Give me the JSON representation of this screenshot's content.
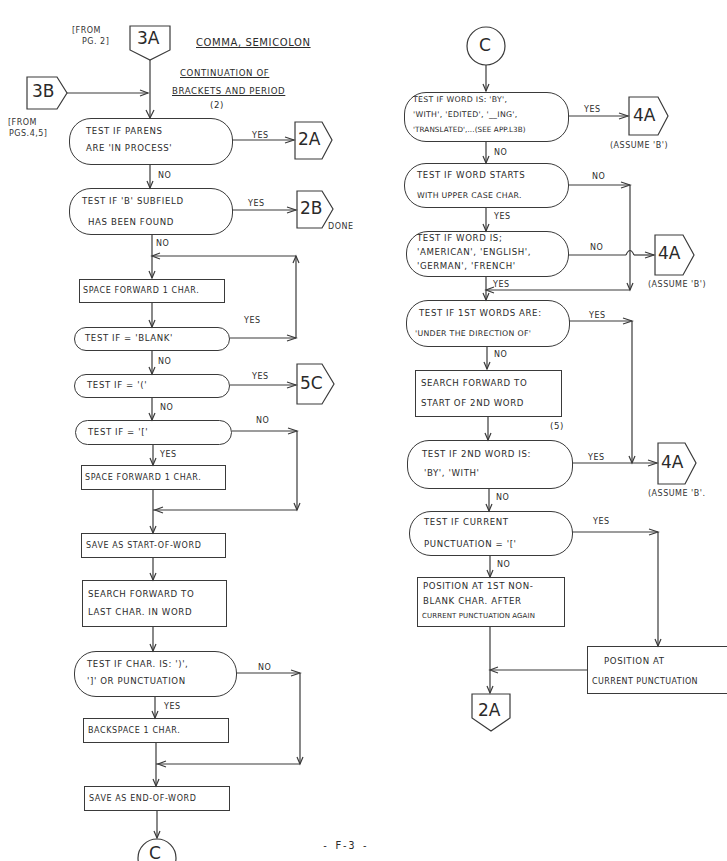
{
  "header": {
    "title": "COMMA, SEMICOLON",
    "subtitle_line1": "CONTINUATION OF",
    "subtitle_line2": "BRACKETS AND PERIOD",
    "step_2": "(2)",
    "page_number": "- F-3 -"
  },
  "connectors": {
    "entry_3a": "3A",
    "entry_3a_note_1": "[FROM",
    "entry_3a_note_2": "PG. 2]",
    "entry_3b": "3B",
    "entry_3b_note_1": "[FROM",
    "entry_3b_note_2": "PGS.4,5]",
    "exit_2a_top": "2A",
    "exit_2b": "2B",
    "exit_2b_note": "DONE",
    "exit_5c": "5C",
    "exit_c_bottom": "C",
    "entry_c_top": "C",
    "exit_4a_1": "4A",
    "exit_4a_1_note": "(ASSUME 'B')",
    "exit_4a_2": "4A",
    "exit_4a_2_note": "(ASSUME 'B')",
    "exit_4a_3": "4A",
    "exit_4a_3_note": "(ASSUME 'B'.",
    "exit_2a_bottom": "2A"
  },
  "left_flow": {
    "parens": {
      "line1": "TEST IF PARENS",
      "line2": "ARE 'IN PROCESS'"
    },
    "b_subfield": {
      "line1": "TEST IF 'B' SUBFIELD",
      "line2": "HAS BEEN FOUND"
    },
    "space_forward_1": "SPACE FORWARD 1 CHAR.",
    "test_blank": "TEST IF = 'BLANK'",
    "test_paren": "TEST IF = '('",
    "test_bracket": "TEST IF = '['",
    "space_forward_2": "SPACE FORWARD 1 CHAR.",
    "save_start": "SAVE AS START-OF-WORD",
    "search_last": {
      "line1": "SEARCH FORWARD TO",
      "line2": "LAST CHAR. IN WORD"
    },
    "test_char": {
      "line1": "TEST IF CHAR. IS: ')',",
      "line2": "']' OR PUNCTUATION"
    },
    "backspace": "BACKSPACE 1 CHAR.",
    "save_end": "SAVE AS END-OF-WORD"
  },
  "right_flow": {
    "test_word_by": {
      "line1": "TEST IF WORD IS: 'BY',",
      "line2": "'WITH', 'EDITED', '__ING',",
      "line3": "'TRANSLATED',...(SEE APP.L3B)"
    },
    "test_upper": {
      "line1": "TEST IF WORD STARTS",
      "line2": "WITH UPPER CASE CHAR."
    },
    "test_lang": {
      "line1": "TEST IF WORD IS;",
      "line2": "'AMERICAN', 'ENGLISH',",
      "line3": "'GERMAN', 'FRENCH'"
    },
    "test_under": {
      "line1": "TEST IF 1ST WORDS ARE:",
      "line2": "'UNDER THE DIRECTION OF'"
    },
    "search_2nd": {
      "line1": "SEARCH FORWARD TO",
      "line2": "START OF 2ND WORD"
    },
    "step_5": "(5)",
    "test_2nd": {
      "line1": "TEST IF 2ND WORD IS:",
      "line2": "'BY', 'WITH'"
    },
    "test_punct": {
      "line1": "TEST IF CURRENT",
      "line2": "PUNCTUATION = '['"
    },
    "position_nonblank": {
      "line1": "POSITION AT 1ST NON-",
      "line2": "BLANK CHAR. AFTER",
      "line3": "CURRENT PUNCTUATION AGAIN"
    },
    "position_current": {
      "line1": "POSITION AT",
      "line2": "CURRENT PUNCTUATION"
    }
  },
  "edge_labels": {
    "yes": "YES",
    "no": "NO"
  }
}
